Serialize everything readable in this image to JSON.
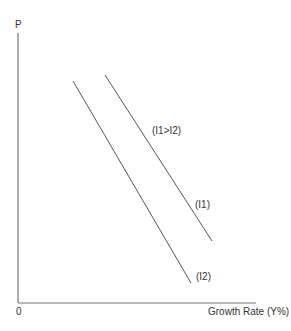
{
  "diagram": {
    "y_axis_label": "P",
    "x_axis_label": "Growth Rate (Y%)",
    "origin_label": "0",
    "annotation": "(I1>I2)",
    "curves": [
      {
        "name": "I1",
        "label": "(I1)",
        "x1": 105,
        "y1": 75,
        "x2": 212,
        "y2": 241
      },
      {
        "name": "I2",
        "label": "(I2)",
        "x1": 73,
        "y1": 81,
        "x2": 191,
        "y2": 283
      }
    ],
    "colors": {
      "axis": "#777777",
      "line": "#555555",
      "text": "#333333"
    }
  }
}
